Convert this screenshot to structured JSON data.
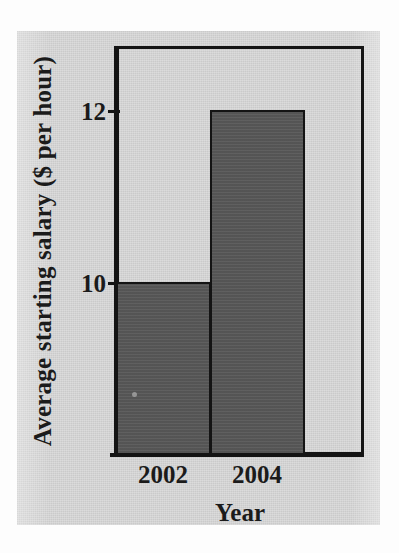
{
  "chart_data": {
    "type": "bar",
    "title": "",
    "categories": [
      "2002",
      "2004"
    ],
    "values": [
      10,
      12
    ],
    "xlabel": "Year",
    "ylabel": "Average starting salary ($ per hour)",
    "ytick_labels": [
      "12",
      "10"
    ],
    "ytick_values": [
      12,
      10
    ],
    "ylim": [
      8,
      12.75
    ],
    "xlim_categories": 2,
    "grid": false,
    "legend": null,
    "series": [
      {
        "name": "Average starting salary",
        "values": [
          10,
          12
        ],
        "units": "$ per hour"
      }
    ],
    "annotations": [],
    "colors": {
      "bar_fill": "#575757",
      "bar_outline": "#141414",
      "axis": "#141414",
      "text": "#1b1b1b",
      "panel_background": "#d3d3d3",
      "page_background": "#fdfdfd"
    }
  },
  "figure": {
    "ylabel": "Average starting salary ($ per hour)",
    "xlabel": "Year",
    "ytick_12": "12",
    "ytick_10": "10",
    "xtick_2002": "2002",
    "xtick_2004": "2004"
  }
}
